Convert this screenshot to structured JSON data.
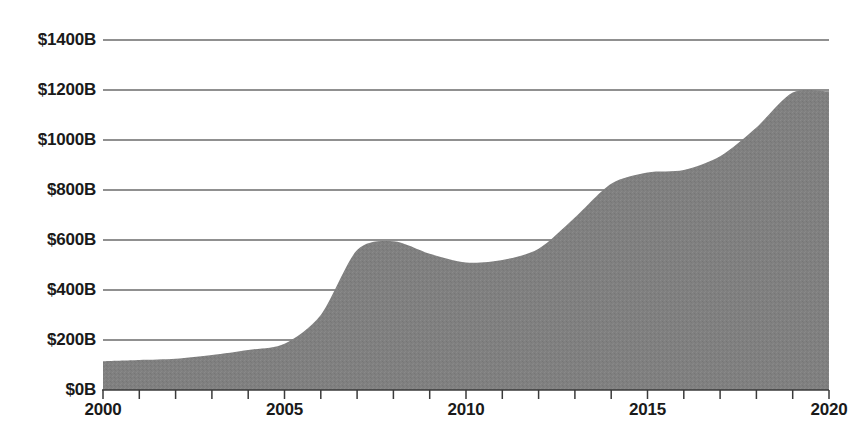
{
  "chart_data": {
    "type": "area",
    "title": "",
    "xlabel": "",
    "ylabel": "",
    "grid": true,
    "legend": false,
    "xlim": [
      2000,
      2020
    ],
    "ylim": [
      0,
      1400
    ],
    "x": [
      2000,
      2001,
      2002,
      2003,
      2004,
      2005,
      2006,
      2007,
      2008,
      2009,
      2010,
      2011,
      2012,
      2013,
      2014,
      2015,
      2016,
      2017,
      2018,
      2019,
      2020
    ],
    "values": [
      115,
      120,
      125,
      140,
      160,
      185,
      300,
      560,
      595,
      545,
      510,
      520,
      565,
      690,
      825,
      870,
      880,
      935,
      1050,
      1190,
      1195
    ],
    "series": [
      {
        "name": "",
        "values": [
          115,
          120,
          125,
          140,
          160,
          185,
          300,
          560,
          595,
          545,
          510,
          520,
          565,
          690,
          825,
          870,
          880,
          935,
          1050,
          1190,
          1195
        ]
      }
    ],
    "y_ticks": [
      0,
      200,
      400,
      600,
      800,
      1000,
      1200,
      1400
    ],
    "y_tick_labels": [
      "$0B",
      "$200B",
      "$400B",
      "$600B",
      "$800B",
      "$1000B",
      "$1200B",
      "$1400B"
    ],
    "x_ticks": [
      2000,
      2001,
      2002,
      2003,
      2004,
      2005,
      2006,
      2007,
      2008,
      2009,
      2010,
      2011,
      2012,
      2013,
      2014,
      2015,
      2016,
      2017,
      2018,
      2019,
      2020
    ],
    "x_tick_labels_shown": [
      "2000",
      "2005",
      "2010",
      "2015",
      "2020"
    ],
    "x_tick_label_values": [
      2000,
      2005,
      2010,
      2015,
      2020
    ],
    "colors": {
      "area_fill": "#808080",
      "gridline": "#6b6b6b",
      "axis": "#3a3a3a",
      "text": "#1a1a1a",
      "background": "#ffffff"
    }
  },
  "axis_labels": {
    "y": [
      "$1400B",
      "$1200B",
      "$1000B",
      "$800B",
      "$600B",
      "$400B",
      "$200B",
      "$0B"
    ],
    "x": [
      "2000",
      "2005",
      "2010",
      "2015",
      "2020"
    ]
  }
}
